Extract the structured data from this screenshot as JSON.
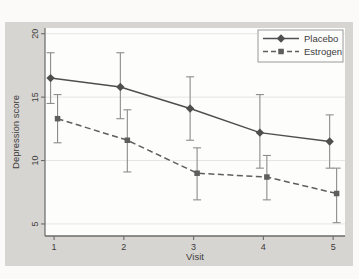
{
  "page": {
    "background": "#fbfaf8"
  },
  "figure": {
    "background": "#d7d5d1",
    "plot_background": "#fdfdfc",
    "axis_color": "#6a6a6a",
    "gridline_color": "#e4e7e5",
    "text_color": "#3c3c3c",
    "error_bar_color": "#8c8c8c",
    "legend_border_color": "#9a9a9a",
    "legend_background": "#fdfdfc"
  },
  "chart_data": {
    "type": "line",
    "title": "",
    "xlabel": "Visit",
    "ylabel": "Depression score",
    "x": [
      1,
      2,
      3,
      4,
      5
    ],
    "xticks": [
      1,
      2,
      3,
      4,
      5
    ],
    "yticks": [
      5,
      10,
      15,
      20
    ],
    "xlim": [
      0.87,
      5.17
    ],
    "ylim": [
      4.05,
      20.45
    ],
    "grid": "horizontal-only",
    "legend_position": "top-right-inside",
    "error_bars": "95% confidence intervals",
    "series": [
      {
        "name": "Placebo",
        "marker": "diamond",
        "line_style": "solid",
        "color": "#4f4f4f",
        "x_offset": -0.05,
        "values": [
          16.5,
          15.8,
          14.1,
          12.2,
          11.5
        ],
        "ci_low": [
          14.5,
          13.3,
          11.6,
          9.4,
          9.4
        ],
        "ci_high": [
          18.5,
          18.5,
          16.6,
          15.2,
          13.6
        ]
      },
      {
        "name": "Estrogen",
        "marker": "square",
        "line_style": "dashed",
        "color": "#5e5e5e",
        "x_offset": 0.05,
        "values": [
          13.3,
          11.6,
          9.0,
          8.7,
          7.4
        ],
        "ci_low": [
          11.4,
          9.1,
          6.9,
          6.9,
          5.1
        ],
        "ci_high": [
          15.2,
          14.0,
          11.0,
          10.4,
          9.4
        ]
      }
    ]
  }
}
